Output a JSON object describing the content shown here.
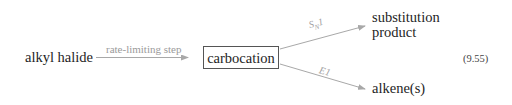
{
  "diagram": {
    "reactant": "alkyl halide",
    "step_label": "rate-limiting step",
    "intermediate": "carbocation",
    "paths": [
      {
        "label_main": "S",
        "label_sub": "N",
        "label_tail": "1",
        "product_line1": "substitution",
        "product_line2": "product"
      },
      {
        "label_main": "E1",
        "product_line1": "alkene(s)"
      }
    ],
    "equation_number": "(9.55)"
  },
  "colors": {
    "text": "#1e1e1e",
    "arrow": "#a8a8a8",
    "box_border": "#555555"
  }
}
